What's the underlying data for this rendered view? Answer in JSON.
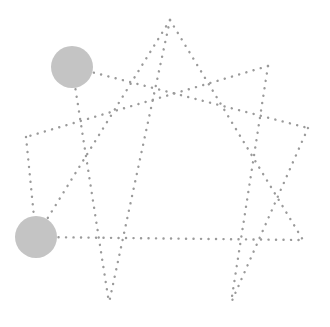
{
  "diagram": {
    "type": "enneagram-star",
    "background": "#ffffff",
    "line_color": "#9a9a9a",
    "circle_color": "#c4c4c4",
    "points": {
      "top": [
        170,
        20
      ],
      "upper_right": [
        268,
        66
      ],
      "right_mid": [
        308,
        128
      ],
      "right": [
        303,
        240
      ],
      "bottom_right": [
        231,
        303
      ],
      "bottom_left": [
        109,
        303
      ],
      "left": [
        36,
        237
      ],
      "upper_left": [
        26,
        137
      ],
      "circle_top": [
        72,
        67
      ]
    },
    "highlighted_nodes": [
      {
        "name": "upper-left-node",
        "cx": 72,
        "cy": 67,
        "r": 21
      },
      {
        "name": "lower-left-node",
        "cx": 36,
        "cy": 237,
        "r": 21
      }
    ]
  }
}
